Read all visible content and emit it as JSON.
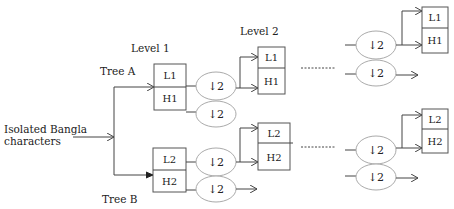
{
  "labels": {
    "input": [
      "Isolated Bangla",
      "characters"
    ],
    "level1": "Level 1",
    "level2": "Level 2",
    "tree_a": "Tree A",
    "tree_b": "Tree B"
  },
  "nodes": {
    "tree_a_level1": {
      "top": "L1",
      "bottom": "H1"
    },
    "tree_b_level1": {
      "top": "L2",
      "bottom": "H2"
    },
    "tree_a_level2": {
      "top": "L1",
      "bottom": "H1"
    },
    "tree_b_level2": {
      "top": "L2",
      "bottom": "H2"
    },
    "tree_a_levelN": {
      "top": "L1",
      "bottom": "H1"
    },
    "tree_b_levelN": {
      "top": "L2",
      "bottom": "H2"
    }
  },
  "downsample": "↓2",
  "colors": {
    "line": "#444444",
    "box_border": "#555555",
    "ellipse_border": "#aaaaaa"
  }
}
